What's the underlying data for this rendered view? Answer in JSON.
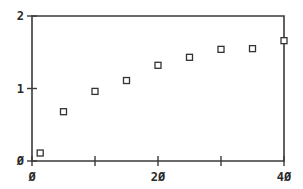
{
  "chart_data": {
    "type": "scatter",
    "title": "",
    "xlabel": "",
    "ylabel": "",
    "xlim": [
      0,
      40
    ],
    "ylim": [
      0,
      2
    ],
    "grid": false,
    "legend": null,
    "marker": "open-square",
    "x_ticks": [
      0,
      10,
      20,
      30,
      40
    ],
    "x_tick_labels": [
      "Ø",
      "",
      "2Ø",
      "",
      "4Ø"
    ],
    "y_ticks": [
      0,
      1,
      2
    ],
    "y_tick_labels": [
      "Ø",
      "1",
      "2"
    ],
    "series": [
      {
        "name": "data",
        "x": [
          1.3,
          5,
          10,
          15,
          20,
          25,
          30,
          35,
          40
        ],
        "y": [
          0.11,
          0.68,
          0.96,
          1.11,
          1.32,
          1.43,
          1.54,
          1.55,
          1.66
        ]
      }
    ]
  }
}
